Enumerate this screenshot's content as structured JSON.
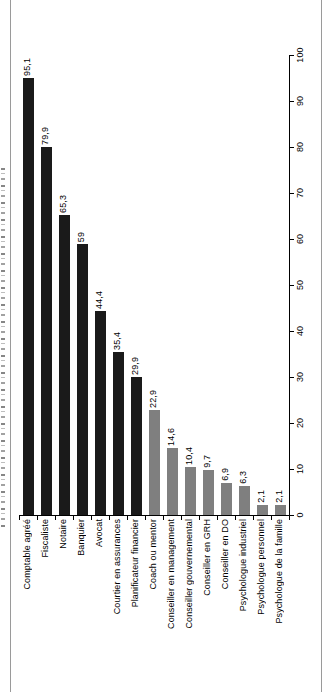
{
  "chart_data": {
    "type": "bar",
    "orientation_note": "landscape bar chart rotated 90deg CCW to portrait; value axis shown on right edge (0 bottom, 100 top); all text reads bottom-to-top",
    "categories": [
      "Comptable agréé",
      "Fiscaliste",
      "Notaire",
      "Banquier",
      "Avocat",
      "Courtier en assurances",
      "Planificateur financier",
      "Coach ou mentor",
      "Conseiller en management",
      "Conseiller gouvernemental",
      "Conseiller en GRH",
      "Conseiller en DO",
      "Psychologue industriel",
      "Psychologue personnel",
      "Psychologue de la famille"
    ],
    "values": [
      95.1,
      79.9,
      65.3,
      59,
      44.4,
      35.4,
      29.9,
      22.9,
      14.6,
      10.4,
      9.7,
      6.9,
      6.3,
      2.1,
      2.1
    ],
    "value_labels": [
      "95,1",
      "79,9",
      "65,3",
      "59",
      "44,4",
      "35,4",
      "29,9",
      "22,9",
      "14,6",
      "10,4",
      "9,7",
      "6,9",
      "6,3",
      "2,1",
      "2,1"
    ],
    "bar_colors": [
      "#1a1a1a",
      "#1a1a1a",
      "#1a1a1a",
      "#1a1a1a",
      "#1a1a1a",
      "#1a1a1a",
      "#1a1a1a",
      "#7f7f7f",
      "#7f7f7f",
      "#7f7f7f",
      "#7f7f7f",
      "#7f7f7f",
      "#7f7f7f",
      "#7f7f7f",
      "#7f7f7f"
    ],
    "value_axis": {
      "min": 0,
      "max": 100,
      "ticks": [
        0,
        10,
        20,
        30,
        40,
        50,
        60,
        70,
        80,
        90,
        100
      ],
      "tick_labels": [
        "0",
        "10",
        "20",
        "30",
        "40",
        "50",
        "60",
        "70",
        "80",
        "90",
        "100"
      ]
    },
    "grid": false,
    "legend": false
  }
}
